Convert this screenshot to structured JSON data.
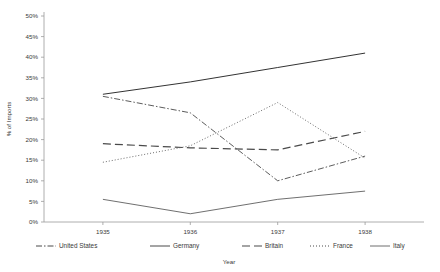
{
  "chart_data": {
    "type": "line",
    "title": "",
    "xlabel": "Year",
    "ylabel": "% of Imports",
    "categories": [
      "1935",
      "1936",
      "1937",
      "1938"
    ],
    "x": [
      1935,
      1936,
      1937,
      1938
    ],
    "ylim": [
      0,
      50
    ],
    "yticks": [
      0,
      5,
      10,
      15,
      20,
      25,
      30,
      35,
      40,
      45,
      50
    ],
    "ytick_labels": [
      "0%",
      "5%",
      "10%",
      "15%",
      "20%",
      "25%",
      "30%",
      "35%",
      "40%",
      "45%",
      "50%"
    ],
    "grid": false,
    "legend_position": "bottom",
    "series": [
      {
        "name": "United States",
        "values": [
          30.5,
          26.5,
          10.0,
          16.0
        ],
        "style": "dash-dot",
        "color": "#4a4a4a",
        "width": 0.9
      },
      {
        "name": "Germany",
        "values": [
          31.0,
          34.0,
          37.5,
          41.0
        ],
        "style": "solid",
        "color": "#333333",
        "width": 1.0
      },
      {
        "name": "Britain",
        "values": [
          19.0,
          18.0,
          17.5,
          22.0
        ],
        "style": "long-dash",
        "color": "#4a4a4a",
        "width": 1.2
      },
      {
        "name": "France",
        "values": [
          14.5,
          18.5,
          29.0,
          15.5
        ],
        "style": "dotted",
        "color": "#5a5a5a",
        "width": 0.9
      },
      {
        "name": "Italy",
        "values": [
          5.5,
          2.0,
          5.5,
          7.5
        ],
        "style": "solid",
        "color": "#4a4a4a",
        "width": 0.8
      }
    ]
  },
  "legend": {
    "items": [
      {
        "label": "United States",
        "style": "dash-dot"
      },
      {
        "label": "Germany",
        "style": "solid"
      },
      {
        "label": "Britain",
        "style": "long-dash"
      },
      {
        "label": "France",
        "style": "dotted"
      },
      {
        "label": "Italy",
        "style": "solid-thin"
      }
    ]
  }
}
